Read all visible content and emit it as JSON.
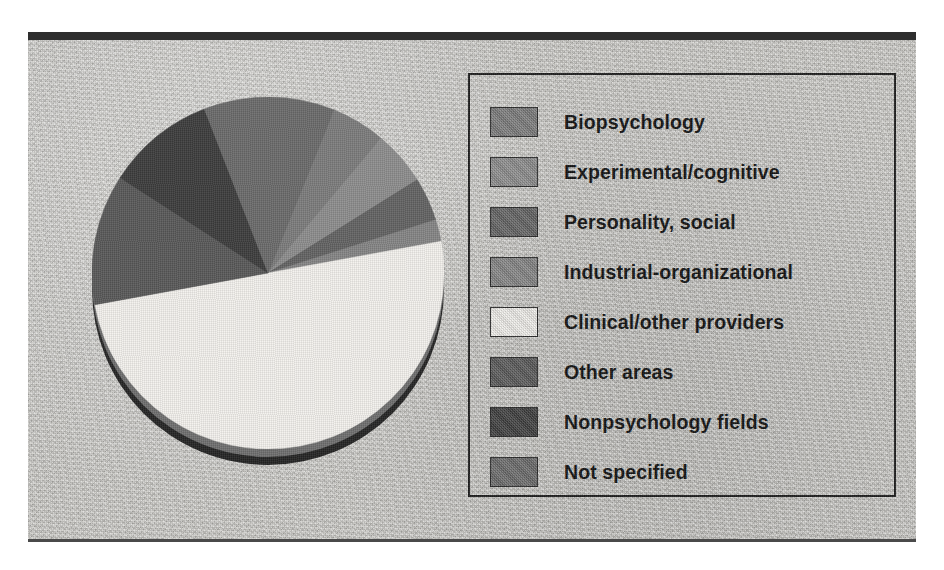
{
  "figure": {
    "top_rule_color": "#2e2e2e",
    "bottom_rule_color": "#4a4a4a",
    "plate_color": "#c9c8c4"
  },
  "legend": {
    "border_color": "#1f1f1f",
    "items": [
      {
        "label": "Biopsychology",
        "color": "#7c7c7c"
      },
      {
        "label": "Experimental/cognitive",
        "color": "#8d8d8d"
      },
      {
        "label": "Personality, social",
        "color": "#636363"
      },
      {
        "label": "Industrial-organizational",
        "color": "#858585"
      },
      {
        "label": "Clinical/other providers",
        "color": "#f3f1ed"
      },
      {
        "label": "Other areas",
        "color": "#595959"
      },
      {
        "label": "Nonpsychology fields",
        "color": "#3d3d3d"
      },
      {
        "label": "Not specified",
        "color": "#6b6b6b"
      }
    ]
  },
  "chart_data": {
    "type": "pie",
    "labels": [
      "Biopsychology",
      "Experimental/cognitive",
      "Personality, social",
      "Industrial-organizational",
      "Clinical/other providers",
      "Other areas",
      "Nonpsychology fields",
      "Not specified"
    ],
    "values": [
      5,
      5,
      4,
      2,
      50,
      12,
      10,
      12
    ],
    "unit": "percent",
    "total": 100,
    "colors": [
      "#7c7c7c",
      "#8d8d8d",
      "#636363",
      "#858585",
      "#f3f1ed",
      "#595959",
      "#3d3d3d",
      "#6b6b6b"
    ],
    "start_angle_deg": 22,
    "direction": "clockwise",
    "legend_position": "right",
    "data_labels_shown": false,
    "grid": false,
    "style": "3d-shaded-disc-with-drop-shadow"
  }
}
